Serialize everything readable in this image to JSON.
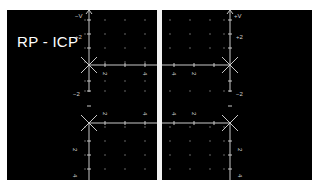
{
  "title": "RP - ICP",
  "colors": {
    "background": "#000000",
    "frame": "#ffffff",
    "axis": "#c8c8c8",
    "grid_dot": "#8a8a8a",
    "label": "#d0d0d0"
  },
  "quadrants": {
    "top_left": {
      "y_axis_label": "−V",
      "y_ticks": [
        "+2",
        "−2"
      ],
      "x_ticks": [
        "2",
        "4"
      ]
    },
    "top_right": {
      "y_axis_label": "+V",
      "y_ticks": [
        "+2",
        "−2"
      ],
      "x_ticks": [
        "4",
        "2"
      ]
    },
    "bottom_left": {
      "x_ticks": [
        "2",
        "4"
      ],
      "y_ticks": [
        "2",
        "4"
      ]
    },
    "bottom_right": {
      "x_ticks": [
        "4",
        "2"
      ],
      "y_ticks": [
        "2",
        "4"
      ]
    }
  }
}
